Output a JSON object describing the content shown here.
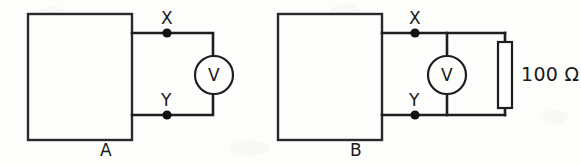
{
  "figure": {
    "type": "circuit-diagram",
    "background_color": "#fdfdfc",
    "line_color": "#1e1e1e"
  },
  "circuits": [
    {
      "id": "A",
      "caption": "A",
      "source_box": {
        "label": "",
        "x": 28,
        "y": 14,
        "width": 104,
        "height": 126
      },
      "terminals": [
        {
          "name": "X",
          "label": "X",
          "cx": 167,
          "cy": 33
        },
        {
          "name": "Y",
          "label": "Y",
          "cx": 167,
          "cy": 115
        }
      ],
      "meter": {
        "type": "voltmeter",
        "label": "V",
        "cx": 214,
        "cy": 75,
        "radius": 19
      },
      "resistor": null
    },
    {
      "id": "B",
      "caption": "B",
      "source_box": {
        "label": "",
        "x": 278,
        "y": 14,
        "width": 104,
        "height": 126
      },
      "terminals": [
        {
          "name": "X",
          "label": "X",
          "cx": 415,
          "cy": 33
        },
        {
          "name": "Y",
          "label": "Y",
          "cx": 415,
          "cy": 115
        }
      ],
      "meter": {
        "type": "voltmeter",
        "label": "V",
        "cx": 447,
        "cy": 75,
        "radius": 19
      },
      "resistor": {
        "value": "100",
        "unit": "Ω",
        "label": "100 Ω",
        "cx": 505,
        "cy": 75,
        "width": 14,
        "height": 66
      }
    }
  ]
}
